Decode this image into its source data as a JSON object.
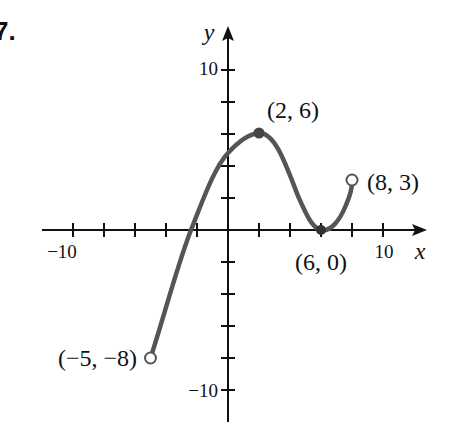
{
  "problem_number": "7.",
  "chart_data": {
    "type": "line",
    "title": "",
    "xlabel": "x",
    "ylabel": "y",
    "xlim": [
      -11,
      12.5
    ],
    "ylim": [
      -12,
      13
    ],
    "x_tick_step": 2,
    "y_tick_step": 2,
    "x_tick_labels": [
      {
        "value": -10,
        "label": "−10"
      },
      {
        "value": 10,
        "label": "10"
      }
    ],
    "y_tick_labels": [
      {
        "value": 10,
        "label": "10"
      },
      {
        "value": -10,
        "label": "−10"
      }
    ],
    "grid": false,
    "legend": null,
    "series": [
      {
        "name": "f(x)",
        "color": "#555555",
        "points": [
          {
            "x": -5,
            "y": -8
          },
          {
            "x": -2.4,
            "y": 0
          },
          {
            "x": 0,
            "y": 4.8
          },
          {
            "x": 2,
            "y": 6
          },
          {
            "x": 6,
            "y": 0
          },
          {
            "x": 8,
            "y": 3
          }
        ]
      }
    ],
    "annotations": [
      {
        "x": -5,
        "y": -8,
        "label": "(−5, −8)",
        "marker": "open"
      },
      {
        "x": 2,
        "y": 6,
        "label": "(2, 6)",
        "marker": "filled"
      },
      {
        "x": 6,
        "y": 0,
        "label": "(6, 0)",
        "marker": "filled"
      },
      {
        "x": 8,
        "y": 3,
        "label": "(8, 3)",
        "marker": "open"
      }
    ]
  },
  "labels": {
    "x_axis": "x",
    "y_axis": "y",
    "x_neg10": "−10",
    "x_pos10": "10",
    "y_pos10": "10",
    "y_neg10": "−10",
    "pt_start": "(−5, −8)",
    "pt_max": "(2, 6)",
    "pt_min": "(6, 0)",
    "pt_end": "(8, 3)"
  }
}
